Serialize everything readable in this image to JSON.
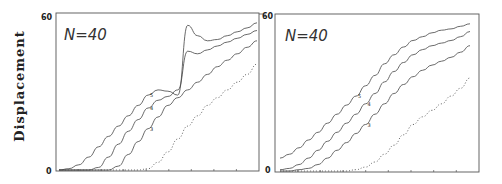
{
  "chart_data": [
    {
      "type": "line",
      "panel": "left",
      "annotation": "N=40",
      "title": "",
      "xlabel": "",
      "ylabel": "Displacement",
      "ylim": [
        0,
        60
      ],
      "yticks": [
        "0",
        "60"
      ],
      "grid": false,
      "x": [
        0,
        5,
        10,
        15,
        20,
        25,
        30,
        35,
        40,
        45,
        50,
        55,
        60,
        65,
        70,
        75,
        80,
        85,
        90,
        95,
        100
      ],
      "series": [
        {
          "name": "5",
          "style": "solid",
          "values": [
            0,
            0.5,
            2,
            5,
            9,
            13,
            17,
            21,
            25,
            29,
            31,
            30.5,
            29,
            56,
            52,
            50,
            50.5,
            52,
            53.5,
            55,
            57
          ]
        },
        {
          "name": "4",
          "style": "solid",
          "values": [
            0,
            0,
            0,
            0,
            1,
            5,
            10,
            15,
            19.5,
            24,
            27,
            28.5,
            31,
            46,
            45,
            46.5,
            48,
            49.5,
            51,
            52.5,
            54
          ]
        },
        {
          "name": "3",
          "style": "solid",
          "values": [
            0,
            0,
            0,
            0,
            0,
            0,
            1.5,
            6,
            11,
            16,
            20.5,
            25,
            28,
            31,
            34,
            37,
            40,
            42.5,
            45,
            47.5,
            50
          ]
        },
        {
          "name": "2",
          "style": "dotted",
          "values": [
            0,
            0,
            0,
            0,
            0,
            0,
            0,
            0,
            0,
            0.5,
            3,
            7,
            12,
            17,
            21,
            25,
            28,
            31,
            34,
            37,
            41
          ]
        }
      ],
      "legend": "inline curve labels 5, 4, 3"
    },
    {
      "type": "line",
      "panel": "right",
      "annotation": "N=40",
      "title": "",
      "xlabel": "",
      "ylabel": "",
      "ylim": [
        0,
        60
      ],
      "yticks": [
        "0",
        "60"
      ],
      "grid": false,
      "x": [
        0,
        5,
        10,
        15,
        20,
        25,
        30,
        35,
        40,
        45,
        50,
        55,
        60,
        65,
        70,
        75,
        80,
        85,
        90,
        95,
        100
      ],
      "series": [
        {
          "name": "5",
          "style": "solid",
          "values": [
            5,
            6.5,
            9,
            12,
            15,
            18.5,
            22,
            25.5,
            29,
            33,
            37,
            41.5,
            45,
            48,
            50.5,
            52,
            53.5,
            54.5,
            55,
            56,
            57
          ]
        },
        {
          "name": "4",
          "style": "solid",
          "values": [
            0.5,
            1,
            2.5,
            5,
            8,
            11.5,
            15,
            18.5,
            22,
            26,
            30,
            34.5,
            38.5,
            42,
            45,
            47,
            48.5,
            49.5,
            50.5,
            52,
            54
          ]
        },
        {
          "name": "3",
          "style": "solid",
          "values": [
            0,
            0,
            0.5,
            1,
            2.5,
            5,
            8,
            11,
            14.5,
            18,
            22,
            26,
            30,
            33.5,
            36.5,
            39,
            41,
            42.5,
            44,
            46,
            48.5
          ]
        },
        {
          "name": "2",
          "style": "dotted",
          "values": [
            0,
            0,
            0,
            0,
            0,
            0,
            0,
            0,
            0.5,
            1.5,
            3.5,
            6.5,
            10,
            14,
            18,
            21,
            23.5,
            26,
            29,
            32,
            36
          ]
        }
      ],
      "legend": "inline curve labels 5, 4, 3"
    }
  ],
  "labels": {
    "ylabel": "Displacement",
    "left_n": "N=40",
    "right_n": "N=40",
    "left_ymax": "60",
    "left_ymin": "0",
    "right_ymax": "60",
    "right_ymin": "0"
  }
}
